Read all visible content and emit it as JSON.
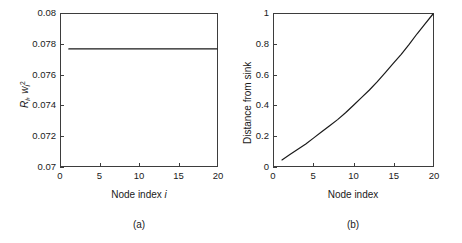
{
  "figure": {
    "background": "#ffffff",
    "line_color": "#1a1a1a",
    "axis_color": "#3d3d3d"
  },
  "panels": [
    {
      "caption": "(a)",
      "xlabel_prefix": "Node index ",
      "xlabel_italic": "i",
      "ylabel_main": "R",
      "ylabel_sub1": "i",
      "ylabel_mid": ", w",
      "ylabel_sub2": "i",
      "ylabel_sup": "2",
      "xticks": [
        "0",
        "5",
        "10",
        "15",
        "20"
      ],
      "yticks": [
        "0.07",
        "0.072",
        "0.074",
        "0.076",
        "0.078",
        "0.08"
      ]
    },
    {
      "caption": "(b)",
      "xlabel": "Node index",
      "ylabel": "Distance from sink",
      "xticks": [
        "0",
        "5",
        "10",
        "15",
        "20"
      ],
      "yticks": [
        "0",
        "0.2",
        "0.4",
        "0.6",
        "0.8",
        "1"
      ]
    }
  ],
  "chart_data": [
    {
      "type": "line",
      "title": "(a)",
      "xlabel": "Node index i",
      "ylabel": "R_i, w_i^2",
      "xlim": [
        0,
        20
      ],
      "ylim": [
        0.07,
        0.08
      ],
      "xticks": [
        0,
        5,
        10,
        15,
        20
      ],
      "yticks": [
        0.07,
        0.072,
        0.074,
        0.076,
        0.078,
        0.08
      ],
      "grid": false,
      "legend": null,
      "series": [
        {
          "name": "R_i, w_i^2",
          "x": [
            1,
            2,
            3,
            4,
            5,
            6,
            7,
            8,
            9,
            10,
            11,
            12,
            13,
            14,
            15,
            16,
            17,
            18,
            19,
            20
          ],
          "y": [
            0.0777,
            0.0777,
            0.0777,
            0.0777,
            0.0777,
            0.0777,
            0.0777,
            0.0777,
            0.0777,
            0.0777,
            0.0777,
            0.0777,
            0.0777,
            0.0777,
            0.0777,
            0.0777,
            0.0777,
            0.0777,
            0.0777,
            0.0777
          ]
        }
      ]
    },
    {
      "type": "line",
      "title": "(b)",
      "xlabel": "Node index",
      "ylabel": "Distance from sink",
      "xlim": [
        0,
        20
      ],
      "ylim": [
        0,
        1
      ],
      "xticks": [
        0,
        5,
        10,
        15,
        20
      ],
      "yticks": [
        0,
        0.2,
        0.4,
        0.6,
        0.8,
        1
      ],
      "grid": false,
      "legend": null,
      "series": [
        {
          "name": "Distance from sink",
          "x": [
            1,
            2,
            3,
            4,
            5,
            6,
            7,
            8,
            9,
            10,
            11,
            12,
            13,
            14,
            15,
            16,
            17,
            18,
            19,
            20
          ],
          "y": [
            0.04,
            0.075,
            0.11,
            0.145,
            0.185,
            0.225,
            0.265,
            0.305,
            0.35,
            0.4,
            0.45,
            0.5,
            0.555,
            0.615,
            0.675,
            0.735,
            0.8,
            0.87,
            0.935,
            1.0
          ]
        }
      ]
    }
  ]
}
